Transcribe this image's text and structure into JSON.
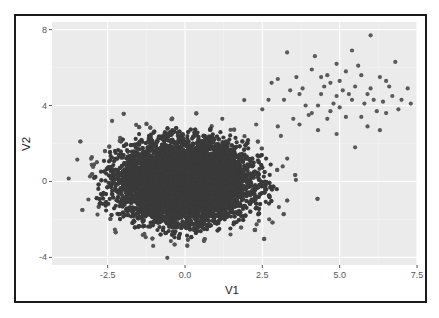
{
  "chart_data": {
    "type": "scatter",
    "title": "",
    "xlabel": "V1",
    "ylabel": "V2",
    "xlim": [
      -4.3,
      7.5
    ],
    "ylim": [
      -4.4,
      8.4
    ],
    "xticks": [
      -2.5,
      0.0,
      2.5,
      5.0,
      7.5
    ],
    "xtick_labels": [
      "-2.5",
      "0.0",
      "2.5",
      "5.0",
      "7.5"
    ],
    "yticks": [
      -4,
      0,
      4,
      8
    ],
    "ytick_labels": [
      "-4",
      "0",
      "4",
      "8"
    ],
    "grid": true,
    "legend": null,
    "series": [
      {
        "name": "main-cluster",
        "description": "dense bivariate normal cloud",
        "center": [
          0,
          0
        ],
        "sd": [
          1,
          1
        ],
        "n": 10000,
        "color": "#3a3a3a"
      },
      {
        "name": "outlier-cluster",
        "description": "sparse group in upper right",
        "center": [
          5,
          5
        ],
        "sd": [
          1,
          1
        ],
        "color": "#5a5a5a",
        "points": [
          [
            6.0,
            7.7
          ],
          [
            3.3,
            6.8
          ],
          [
            4.2,
            6.6
          ],
          [
            5.4,
            6.9
          ],
          [
            4.9,
            6.2
          ],
          [
            6.8,
            6.3
          ],
          [
            4.1,
            5.9
          ],
          [
            3.6,
            5.5
          ],
          [
            4.6,
            5.6
          ],
          [
            5.2,
            5.8
          ],
          [
            5.0,
            5.3
          ],
          [
            5.7,
            5.6
          ],
          [
            6.3,
            5.5
          ],
          [
            2.8,
            5.2
          ],
          [
            3.0,
            5.4
          ],
          [
            4.5,
            5.0
          ],
          [
            4.7,
            5.2
          ],
          [
            5.5,
            5.0
          ],
          [
            6.0,
            4.9
          ],
          [
            6.6,
            5.0
          ],
          [
            7.2,
            4.9
          ],
          [
            3.4,
            4.8
          ],
          [
            3.7,
            4.6
          ],
          [
            4.4,
            4.6
          ],
          [
            4.9,
            4.5
          ],
          [
            5.3,
            4.6
          ],
          [
            5.9,
            4.6
          ],
          [
            6.1,
            4.3
          ],
          [
            6.7,
            4.5
          ],
          [
            2.7,
            4.3
          ],
          [
            3.2,
            4.3
          ],
          [
            3.9,
            4.0
          ],
          [
            4.3,
            4.0
          ],
          [
            4.8,
            4.1
          ],
          [
            5.4,
            4.3
          ],
          [
            5.8,
            4.1
          ],
          [
            6.4,
            4.2
          ],
          [
            7.0,
            4.3
          ],
          [
            2.5,
            3.8
          ],
          [
            3.5,
            3.3
          ],
          [
            4.0,
            3.5
          ],
          [
            4.6,
            3.3
          ],
          [
            5.2,
            3.4
          ],
          [
            5.7,
            3.4
          ],
          [
            6.5,
            3.6
          ],
          [
            6.9,
            3.8
          ],
          [
            3.0,
            2.9
          ],
          [
            4.3,
            2.7
          ],
          [
            4.9,
            2.5
          ],
          [
            5.9,
            2.9
          ],
          [
            6.3,
            2.7
          ],
          [
            5.5,
            1.8
          ],
          [
            3.7,
            3.0
          ],
          [
            4.1,
            3.6
          ],
          [
            5.0,
            3.9
          ],
          [
            6.2,
            3.7
          ],
          [
            3.8,
            4.9
          ],
          [
            5.6,
            6.1
          ],
          [
            4.4,
            5.5
          ],
          [
            6.5,
            5.3
          ],
          [
            5.1,
            4.8
          ],
          [
            4.7,
            3.7
          ],
          [
            3.1,
            2.4
          ],
          [
            2.3,
            3.0
          ],
          [
            7.3,
            4.1
          ]
        ]
      }
    ]
  },
  "plot": {
    "panel_bg": "#ebebeb",
    "grid_major": "#ffffff",
    "grid_minor": "#f4f4f4",
    "frame_color": "#1a1a1a"
  }
}
